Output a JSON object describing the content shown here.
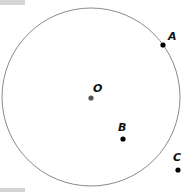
{
  "diagram": {
    "type": "geometry-circle",
    "circle": {
      "center_label": "O",
      "stroke": "#888888"
    },
    "points": [
      {
        "label": "O",
        "role": "center",
        "color": "#555555"
      },
      {
        "label": "A",
        "role": "on-circle",
        "color": "#000000"
      },
      {
        "label": "B",
        "role": "inside",
        "color": "#000000"
      },
      {
        "label": "C",
        "role": "outside",
        "color": "#000000"
      }
    ]
  }
}
